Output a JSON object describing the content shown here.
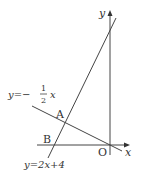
{
  "diagram": {
    "type": "coordinate-graph",
    "colors": {
      "line": "#444444",
      "text": "#333333",
      "background": "#ffffff"
    },
    "axes": {
      "x_label": "x",
      "y_label": "y",
      "origin_label": "O"
    },
    "lines": [
      {
        "equation_prefix": "y=−",
        "fraction_num": "1",
        "fraction_den": "2",
        "equation_suffix": "x",
        "full": "y=−1/2x"
      },
      {
        "equation": "y=2x+4",
        "full": "y=2x+4"
      }
    ],
    "points": [
      {
        "label": "A",
        "description": "intersection of y=2x+4 and y=−1/2x"
      },
      {
        "label": "B",
        "description": "x-intercept of y=2x+4"
      }
    ]
  }
}
